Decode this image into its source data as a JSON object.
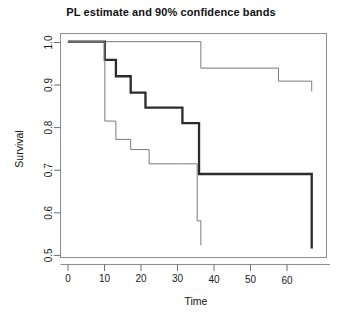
{
  "chart_data": {
    "type": "line",
    "title": "PL estimate and 90% confidence bands",
    "xlabel": "Time",
    "ylabel": "Survival",
    "xlim": [
      -2,
      70
    ],
    "ylim": [
      0.47,
      1.02
    ],
    "xticks": [
      0,
      10,
      20,
      30,
      40,
      50,
      60
    ],
    "xtick_labels": [
      "0",
      "10",
      "20",
      "30",
      "40",
      "50",
      "60"
    ],
    "yticks": [
      0.5,
      0.6,
      0.7,
      0.8,
      0.9,
      1.0
    ],
    "ytick_labels": [
      "0.5",
      "0.6",
      "0.7",
      "0.8",
      "0.9",
      "1.0"
    ],
    "grid": false,
    "legend": null,
    "step_type": "post",
    "series": [
      {
        "name": "Upper 90% confidence band",
        "style": "thin",
        "x": [
          0,
          10,
          13,
          35,
          36,
          57,
          66,
          66
        ],
        "values": [
          1.0,
          1.0,
          1.0,
          1.0,
          0.935,
          0.903,
          0.903,
          0.878
        ]
      },
      {
        "name": "PL estimate",
        "style": "bold",
        "x": [
          0,
          10,
          13,
          17,
          21,
          31,
          35.5,
          57,
          66,
          66
        ],
        "values": [
          1.0,
          0.955,
          0.915,
          0.875,
          0.838,
          0.8,
          0.675,
          0.675,
          0.6,
          0.492
        ]
      },
      {
        "name": "Lower 90% confidence band",
        "style": "thin",
        "x": [
          0,
          10,
          13,
          17,
          22,
          30,
          35,
          36
        ],
        "values": [
          1.0,
          0.805,
          0.76,
          0.735,
          0.7,
          0.7,
          0.56,
          0.5
        ]
      }
    ]
  }
}
